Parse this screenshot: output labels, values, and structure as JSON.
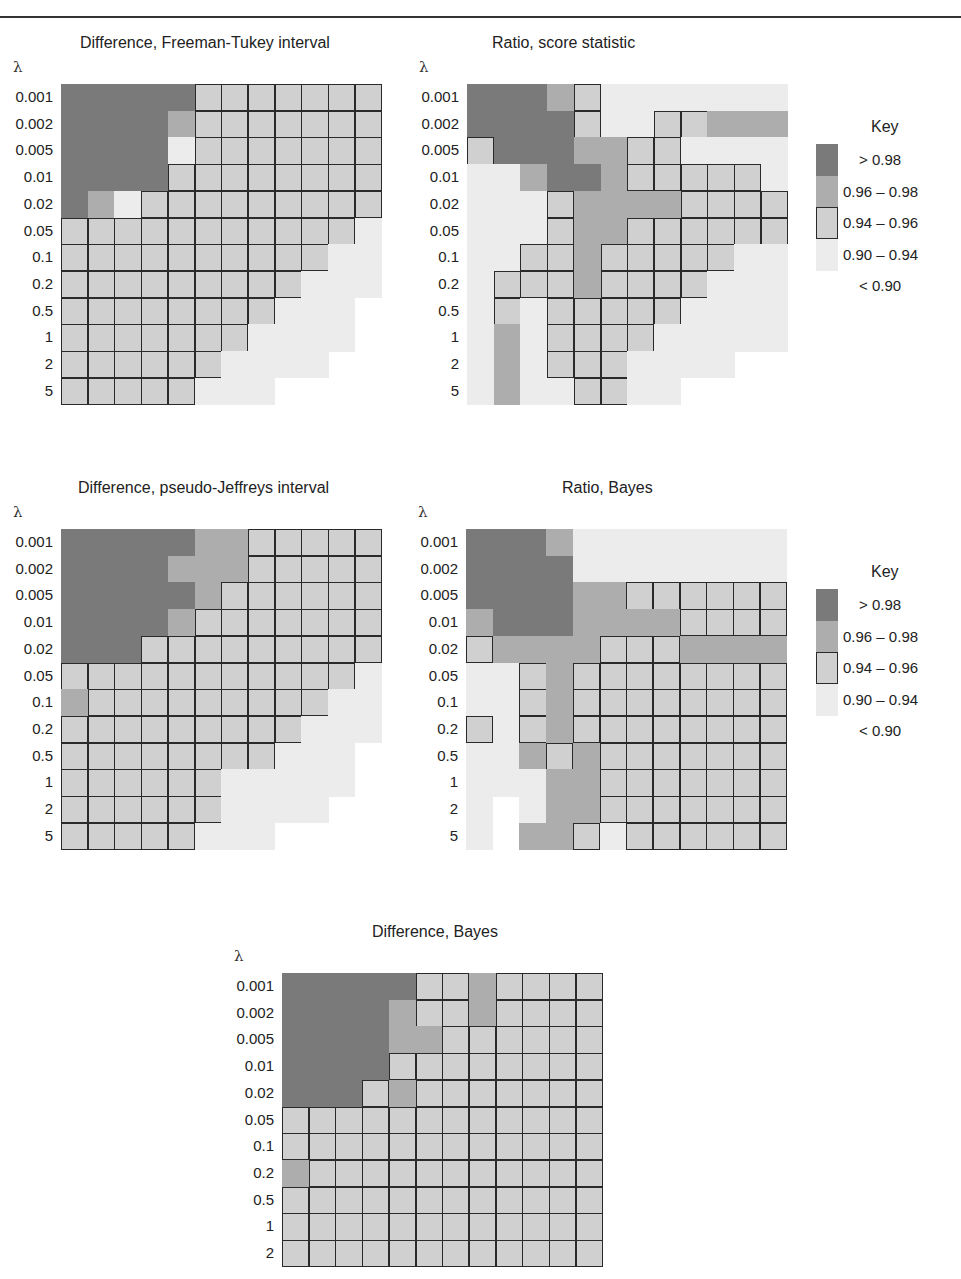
{
  "legend": {
    "title": "Key",
    "items": [
      {
        "code": "D",
        "label": "> 0.98",
        "color": "#7a7a7a"
      },
      {
        "code": "M",
        "label": "0.96 – 0.98",
        "color": "#adadad"
      },
      {
        "code": "B",
        "label": "0.94 – 0.96",
        "color": "#d0d0d0"
      },
      {
        "code": "L",
        "label": "0.90 – 0.94",
        "color": "#ececec"
      },
      {
        "code": "N",
        "label": "< 0.90",
        "color": "#ffffff"
      }
    ]
  },
  "y_axis_symbol": "λ",
  "chart_data": [
    {
      "type": "heatmap",
      "title": "Difference, Freeman-Tukey interval",
      "ylabel": "λ",
      "rows": [
        "0.001",
        "0.002",
        "0.005",
        "0.01",
        "0.02",
        "0.05",
        "0.1",
        "0.2",
        "0.5",
        "1",
        "2",
        "5"
      ],
      "n_cols": 12,
      "grid": [
        "DDDDDBBBBBBB",
        "DDDDMBBBBBBB",
        "DDDDLBBBBBBB",
        "DDDDBBBBBBBB",
        "DMLBBBBBBBBB",
        "BBBBBBBBBBBL",
        "BBBBBBBBBBLL",
        "BBBBBBBBBLLL",
        "BBBBBBBBLLL.",
        "BBBBBBBLLLL.",
        "BBBBBBLLLL..",
        "BBBBBLLL...."
      ]
    },
    {
      "type": "heatmap",
      "title": "Ratio, score statistic",
      "ylabel": "λ",
      "rows": [
        "0.001",
        "0.002",
        "0.005",
        "0.01",
        "0.02",
        "0.05",
        "0.1",
        "0.2",
        "0.5",
        "1",
        "2",
        "5"
      ],
      "n_cols": 12,
      "grid": [
        "DDDMBLLLLLLL",
        "DDDDBLLBBMMM",
        "BDDDMMBBLLLL",
        "LLMDDMBBBBBL",
        "LLLBMMMMBBBB",
        "LLLBMMBBBBBB",
        "LLBBMBBBBBLL",
        "LBBBMBBBBLLL",
        "LBLBBBBBLLLL",
        "LMLBBBBLLLLL",
        "LMLBBBLLLL..",
        "LMLLBBLL...."
      ]
    },
    {
      "type": "heatmap",
      "title": "Difference, pseudo-Jeffreys interval",
      "ylabel": "λ",
      "rows": [
        "0.001",
        "0.002",
        "0.005",
        "0.01",
        "0.02",
        "0.05",
        "0.1",
        "0.2",
        "0.5",
        "1",
        "2",
        "5"
      ],
      "n_cols": 12,
      "grid": [
        "DDDDDMMBBBBB",
        "DDDDMMMBBBBB",
        "DDDDDMBBBBBB",
        "DDDDMBBBBBBB",
        "DDDBBBBBBBBB",
        "BBBBBBBBBBBL",
        "MBBBBBBBBBLL",
        "BBBBBBBBBLLL",
        "BBBBBBBBLLL.",
        "BBBBBBLLLLL.",
        "BBBBBBLLLL..",
        "BBBBBLLL...."
      ]
    },
    {
      "type": "heatmap",
      "title": "Ratio, Bayes",
      "ylabel": "λ",
      "rows": [
        "0.001",
        "0.002",
        "0.005",
        "0.01",
        "0.02",
        "0.05",
        "0.1",
        "0.2",
        "0.5",
        "1",
        "2",
        "5"
      ],
      "n_cols": 12,
      "grid": [
        "DDDMLLLLLLLL",
        "DDDDLLLLLLLL",
        "DDDDMMBBBBBB",
        "MDDDMMMMBBBB",
        "BMMMMBBBMMMM",
        "LLBMBBBBBBBB",
        "LLBMBBBBBBBB",
        "BLBMBBBBBBBB",
        "LLMBMBBBBBBB",
        "LLLMMBBBBBBB",
        "L.LMMBBBBBBB",
        "L.MMBLBBBBBB"
      ]
    },
    {
      "type": "heatmap",
      "title": "Difference, Bayes",
      "ylabel": "λ",
      "rows": [
        "0.001",
        "0.002",
        "0.005",
        "0.01",
        "0.02",
        "0.05",
        "0.1",
        "0.2",
        "0.5",
        "1",
        "2"
      ],
      "n_cols": 12,
      "grid": [
        "DDDDDBBMBBBB",
        "DDDDMBBMBBBB",
        "DDDDMMBBBBBB",
        "DDDDBBBBBBBB",
        "DDDBMBBBBBBB",
        "BBBBBBBBBBBB",
        "BBBBBBBBBBBB",
        "MBBBBBBBBBBB",
        "BBBBBBBBBBBB",
        "BBBBBBBBBBBB",
        "BBBBBBBBBBBB"
      ]
    }
  ]
}
